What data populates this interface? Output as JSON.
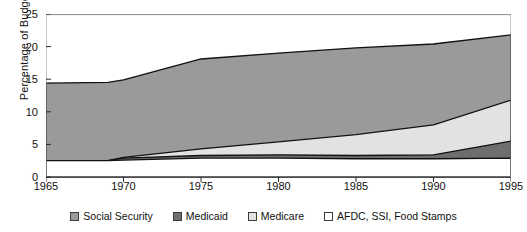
{
  "chart_data": {
    "type": "area",
    "title": "",
    "xlabel": "",
    "ylabel": "Percentage of Budget",
    "xlim": [
      1965,
      1995
    ],
    "ylim": [
      0,
      25
    ],
    "xticks": [
      1965,
      1970,
      1975,
      1980,
      1985,
      1990,
      1995
    ],
    "yticks": [
      0,
      5,
      10,
      15,
      20,
      25
    ],
    "grid": false,
    "stacked": true,
    "legend_position": "bottom",
    "x": [
      1965,
      1969,
      1970,
      1975,
      1980,
      1985,
      1990,
      1995
    ],
    "series": [
      {
        "name": "AFDC, SSI, Food Stamps",
        "color": "#ffffff",
        "values": [
          2.5,
          2.5,
          2.6,
          2.9,
          2.9,
          2.8,
          2.8,
          2.9
        ]
      },
      {
        "name": "Medicaid",
        "color": "#6e6e6e",
        "values": [
          0.0,
          0.0,
          0.3,
          0.4,
          0.5,
          0.5,
          0.6,
          2.6
        ]
      },
      {
        "name": "Medicare",
        "color": "#e2e2e2",
        "values": [
          0.0,
          0.0,
          0.1,
          1.0,
          2.0,
          3.2,
          4.6,
          6.3
        ]
      },
      {
        "name": "Social Security",
        "color": "#9a9a9a",
        "values": [
          11.9,
          12.0,
          11.9,
          13.8,
          13.6,
          13.3,
          12.4,
          10.0
        ]
      }
    ],
    "cumulative_tops": {
      "AFDC, SSI, Food Stamps": [
        2.5,
        2.5,
        2.6,
        2.9,
        2.9,
        2.8,
        2.8,
        2.9
      ],
      "Medicaid": [
        2.5,
        2.5,
        2.9,
        3.3,
        3.4,
        3.3,
        3.4,
        5.5
      ],
      "Medicare": [
        2.5,
        2.5,
        3.0,
        4.3,
        5.4,
        6.5,
        8.0,
        11.8
      ],
      "Social Security": [
        14.4,
        14.5,
        14.9,
        18.1,
        19.0,
        19.8,
        20.4,
        21.8
      ]
    }
  },
  "legend": {
    "items": [
      {
        "label": "Social Security",
        "color": "#9a9a9a"
      },
      {
        "label": "Medicaid",
        "color": "#6e6e6e"
      },
      {
        "label": "Medicare",
        "color": "#e2e2e2"
      },
      {
        "label": "AFDC, SSI, Food Stamps",
        "color": "#ffffff"
      }
    ]
  }
}
